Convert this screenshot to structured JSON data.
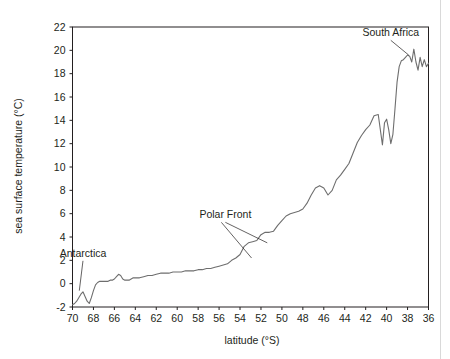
{
  "chart_data": {
    "type": "line",
    "title": "",
    "xlabel": "latitude (°S)",
    "ylabel": "sea surface temperature (°C)",
    "xlim": [
      70,
      36
    ],
    "ylim": [
      -2,
      22
    ],
    "x_inverted": true,
    "grid": false,
    "legend": null,
    "line_color": "#6e6e6e",
    "axis_color": "#231f20",
    "xticks": [
      70,
      68,
      66,
      64,
      62,
      60,
      58,
      56,
      54,
      52,
      50,
      48,
      46,
      44,
      42,
      40,
      38,
      36
    ],
    "yticks": [
      -2,
      0,
      2,
      4,
      6,
      8,
      10,
      12,
      14,
      16,
      18,
      20,
      22
    ],
    "series": [
      {
        "name": "sea surface temperature",
        "x": [
          70.0,
          69.8,
          69.6,
          69.4,
          69.2,
          69.0,
          68.8,
          68.6,
          68.4,
          68.2,
          68.0,
          67.8,
          67.6,
          67.4,
          67.2,
          67.0,
          66.8,
          66.6,
          66.4,
          66.2,
          66.0,
          65.8,
          65.6,
          65.4,
          65.2,
          65.0,
          64.8,
          64.6,
          64.4,
          64.2,
          64.0,
          63.6,
          63.2,
          62.8,
          62.4,
          62.0,
          61.6,
          61.2,
          60.8,
          60.4,
          60.0,
          59.6,
          59.2,
          58.8,
          58.4,
          58.0,
          57.6,
          57.2,
          56.8,
          56.4,
          56.0,
          55.6,
          55.2,
          54.8,
          54.4,
          54.0,
          53.6,
          53.2,
          52.8,
          52.4,
          52.0,
          51.6,
          51.2,
          50.8,
          50.4,
          50.0,
          49.6,
          49.2,
          48.8,
          48.4,
          48.0,
          47.6,
          47.2,
          46.8,
          46.4,
          46.0,
          45.6,
          45.2,
          44.8,
          44.4,
          44.0,
          43.6,
          43.2,
          42.8,
          42.4,
          42.0,
          41.6,
          41.2,
          40.8,
          40.4,
          40.2,
          40.0,
          39.8,
          39.6,
          39.4,
          39.2,
          39.0,
          38.8,
          38.6,
          38.4,
          38.2,
          38.0,
          37.8,
          37.6,
          37.4,
          37.2,
          37.0,
          36.8,
          36.6,
          36.4,
          36.2,
          36.0
        ],
        "y": [
          -1.8,
          -1.7,
          -1.5,
          -1.2,
          -0.9,
          -0.7,
          -1.1,
          -1.5,
          -1.7,
          -1.2,
          -0.6,
          -0.1,
          0.1,
          0.2,
          0.2,
          0.2,
          0.2,
          0.2,
          0.3,
          0.3,
          0.4,
          0.6,
          0.8,
          0.7,
          0.4,
          0.3,
          0.3,
          0.3,
          0.4,
          0.5,
          0.5,
          0.5,
          0.6,
          0.7,
          0.7,
          0.8,
          0.9,
          0.9,
          0.9,
          1.0,
          1.0,
          1.0,
          1.1,
          1.1,
          1.1,
          1.2,
          1.2,
          1.3,
          1.3,
          1.4,
          1.5,
          1.6,
          1.7,
          2.0,
          2.2,
          2.5,
          3.2,
          3.5,
          3.6,
          3.7,
          4.2,
          4.4,
          4.4,
          4.5,
          5.0,
          5.4,
          5.8,
          6.0,
          6.1,
          6.2,
          6.4,
          6.9,
          7.6,
          8.2,
          8.4,
          8.2,
          7.6,
          8.0,
          8.9,
          9.3,
          9.8,
          10.3,
          11.2,
          12.1,
          12.7,
          13.2,
          13.6,
          14.4,
          14.5,
          11.9,
          13.8,
          14.1,
          13.2,
          12.0,
          12.8,
          15.0,
          17.3,
          18.6,
          19.1,
          19.2,
          19.4,
          19.6,
          19.5,
          19.0,
          20.1,
          19.0,
          18.3,
          19.4,
          18.6,
          19.2,
          18.6,
          18.9
        ]
      }
    ],
    "annotations": [
      {
        "name": "antarctica",
        "label": "Antarctica",
        "label_x": 69.0,
        "label_y": 2.3,
        "point_x": 69.35,
        "point_y": -0.6
      },
      {
        "name": "polar-front",
        "label": "Polar Front",
        "label_x": 55.4,
        "label_y": 5.6,
        "point_x": 51.4,
        "point_y": 3.5,
        "point2_x": 52.9,
        "point2_y": 2.2
      },
      {
        "name": "south-africa",
        "label": "South Africa",
        "label_x": 39.6,
        "label_y": 21.2,
        "point_x": 37.9,
        "point_y": 19.6
      }
    ]
  }
}
